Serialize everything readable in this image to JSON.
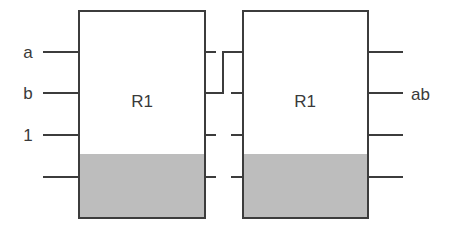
{
  "diagram": {
    "type": "cascaded register blocks",
    "colors": {
      "line": "#3c3c3c",
      "shade": "#bdbdbd",
      "text": "#3a3a3a",
      "background": "#ffffff"
    },
    "blocks": [
      {
        "id": "left",
        "label": "R1",
        "inputs": [
          "a",
          "b",
          "1",
          ""
        ],
        "outputs": [
          "",
          "",
          "",
          ""
        ]
      },
      {
        "id": "right",
        "label": "R1",
        "inputs": [
          "",
          "",
          "",
          ""
        ],
        "outputs": [
          "",
          "ab",
          "",
          ""
        ]
      }
    ],
    "connections": [
      {
        "from": "left.output.2",
        "to": "right.input.1",
        "description": "crossed wire from left block second output up to right block first input"
      }
    ]
  }
}
